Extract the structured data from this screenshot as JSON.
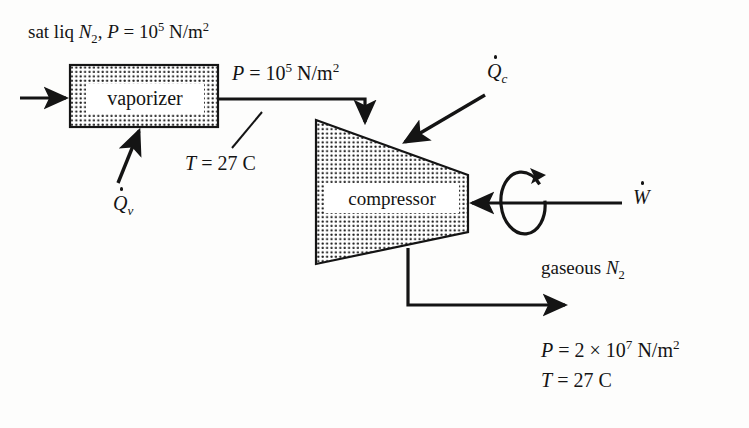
{
  "figure": {
    "ink_color": "#141414",
    "paper_color": "#fdfdfc"
  },
  "equipment": {
    "vaporizer": {
      "label": "vaporizer",
      "fill": "stipple"
    },
    "compressor": {
      "label": "compressor",
      "fill": "stipple"
    }
  },
  "labels": {
    "feed_stream": {
      "prefix": "sat liq ",
      "species": "N",
      "species_sub": "2",
      "separator": ", ",
      "var": "P",
      "equals": " = ",
      "base": "10",
      "exponent": "5",
      "units": " N/m",
      "units_exp": "2"
    },
    "intermediate_pressure": {
      "var": "P",
      "equals": " = ",
      "base": "10",
      "exponent": "5",
      "units": " N/m",
      "units_exp": "2"
    },
    "intermediate_temperature": {
      "var": "T",
      "equals": " = ",
      "value": "27 C"
    },
    "vaporizer_heat": {
      "symbol": "Q",
      "subscript": "v"
    },
    "compressor_heat": {
      "symbol": "Q",
      "subscript": "c"
    },
    "shaft_work": {
      "symbol": "W"
    },
    "product_stream": {
      "prefix": "gaseous ",
      "species": "N",
      "species_sub": "2"
    },
    "outlet_pressure": {
      "var": "P",
      "equals": " = ",
      "coefficient": "2 ",
      "times": "×",
      "base": " 10",
      "exponent": "7",
      "units": " N/m",
      "units_exp": "2"
    },
    "outlet_temperature": {
      "var": "T",
      "equals": " = ",
      "value": "27 C"
    }
  }
}
